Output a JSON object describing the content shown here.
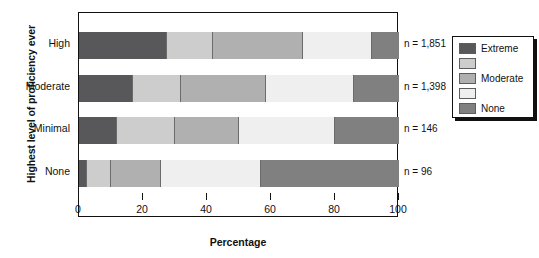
{
  "chart_data": {
    "type": "bar",
    "orientation": "horizontal",
    "stacked": true,
    "title": "",
    "xlabel": "Percentage",
    "ylabel": "Highest level of proficiency ever",
    "xlim": [
      0,
      100
    ],
    "xticks": [
      0,
      20,
      40,
      60,
      80,
      100
    ],
    "xtick_labels": [
      "0",
      "20",
      "40",
      "60",
      "80",
      "100"
    ],
    "grid": false,
    "legend_position": "right",
    "categories": [
      "High",
      "Moderate",
      "Minimal",
      "None"
    ],
    "series": [
      {
        "name": "Extreme",
        "color": "#58585a",
        "values": [
          27.5,
          17.0,
          12.0,
          2.5
        ]
      },
      {
        "name": "",
        "color": "#cdcdcd",
        "values": [
          14.5,
          15.0,
          18.0,
          7.5
        ]
      },
      {
        "name": "Moderate",
        "color": "#b0b0b0",
        "values": [
          28.0,
          26.5,
          20.0,
          15.5
        ]
      },
      {
        "name": "",
        "color": "#efefef",
        "values": [
          21.5,
          27.5,
          30.0,
          31.5
        ]
      },
      {
        "name": "None",
        "color": "#808080",
        "values": [
          8.5,
          14.0,
          20.0,
          43.0
        ]
      }
    ],
    "annotations": [
      {
        "category": "High",
        "text": "n = 1,851",
        "n": "1,851"
      },
      {
        "category": "Moderate",
        "text": "n = 1,398",
        "n": "1,398"
      },
      {
        "category": "Minimal",
        "text": "n = 146",
        "n": "146"
      },
      {
        "category": "None",
        "text": "n = 96",
        "n": "96"
      }
    ],
    "legend_entries": [
      {
        "label": "Extreme",
        "color": "#58585a"
      },
      {
        "label": "",
        "color": "#cdcdcd"
      },
      {
        "label": "Moderate",
        "color": "#b0b0b0"
      },
      {
        "label": "",
        "color": "#efefef"
      },
      {
        "label": "None",
        "color": "#808080"
      }
    ]
  },
  "axis": {
    "y_title": "Highest level of proficiency ever",
    "x_title": "Percentage",
    "cat_0": "High",
    "cat_1": "Moderate",
    "cat_2": "Minimal",
    "cat_3": "None",
    "tick_0": "0",
    "tick_1": "20",
    "tick_2": "40",
    "tick_3": "60",
    "tick_4": "80",
    "tick_5": "100"
  },
  "n_labels": {
    "high": "n = 1,851",
    "moderate": "n = 1,398",
    "minimal": "n = 146",
    "none": "n = 96"
  },
  "legend": {
    "item_0": "Extreme",
    "item_1": "",
    "item_2": "Moderate",
    "item_3": "",
    "item_4": "None"
  }
}
